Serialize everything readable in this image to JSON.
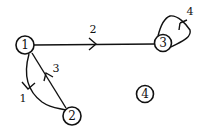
{
  "diagram": {
    "type": "directed-graph",
    "nodes": [
      {
        "id": "1",
        "label": "1",
        "x": 25,
        "y": 45,
        "r": 9
      },
      {
        "id": "2",
        "label": "2",
        "x": 72,
        "y": 116,
        "r": 9
      },
      {
        "id": "3",
        "label": "3",
        "x": 163,
        "y": 43,
        "r": 8.5
      },
      {
        "id": "4",
        "label": "4",
        "x": 145,
        "y": 94,
        "r": 8.5
      }
    ],
    "edges": [
      {
        "id": "e1",
        "label": "1",
        "from": "1",
        "to": "2"
      },
      {
        "id": "e2",
        "label": "2",
        "from": "1",
        "to": "3"
      },
      {
        "id": "e3",
        "label": "3",
        "from": "2",
        "to": "1"
      },
      {
        "id": "e4",
        "label": "4",
        "from": "3",
        "to": "3"
      }
    ]
  }
}
